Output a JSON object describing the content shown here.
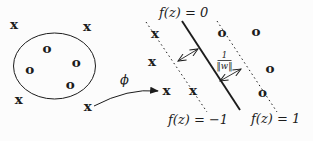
{
  "colors": {
    "ink": "#1c1c1c",
    "background": "#fcfcfc"
  },
  "input_space": {
    "description_role": "input space with non-separable classes",
    "x_markers": [
      "x",
      "x",
      "x",
      "x"
    ],
    "o_markers": [
      "o",
      "o",
      "o",
      "o"
    ]
  },
  "mapping": {
    "phi_label": "ϕ"
  },
  "feature_space": {
    "description_role": "feature space with linear separating hyperplane",
    "hyperplane_label": "f(z) = 0",
    "negative_margin_label": "f(z) = −1",
    "positive_margin_label": "f(z) = 1",
    "margin_width": {
      "numerator": "1",
      "denominator": "‖w‖"
    },
    "x_markers": [
      "x",
      "x",
      "x",
      "x"
    ],
    "o_markers": [
      "o",
      "o",
      "o",
      "o"
    ]
  }
}
